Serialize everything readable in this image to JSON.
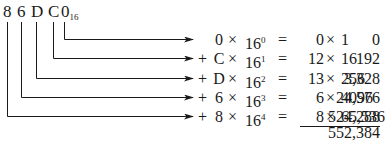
{
  "number": {
    "digits": [
      "8",
      "6",
      "D",
      "C",
      "0"
    ],
    "base_subscript": "16"
  },
  "rows": [
    {
      "plus": "",
      "digit": "0",
      "power": "0",
      "value": "0",
      "multiplier": "1",
      "result": "0"
    },
    {
      "plus": "+",
      "digit": "C",
      "power": "1",
      "value": "12",
      "multiplier": "16",
      "result": "192"
    },
    {
      "plus": "+",
      "digit": "D",
      "power": "2",
      "value": "13",
      "multiplier": "256",
      "result": "3,328"
    },
    {
      "plus": "+",
      "digit": "6",
      "power": "3",
      "value": "6",
      "multiplier": "4096",
      "result": "24,576"
    },
    {
      "plus": "+",
      "digit": "8",
      "power": "4",
      "value": "8",
      "multiplier": "65,536",
      "result": "524,288"
    }
  ],
  "symbols": {
    "times": "×",
    "equals": "=",
    "base": "16"
  },
  "total": "552,384",
  "colors": {
    "ink": "#1a1a1a",
    "background": "#ffffff"
  }
}
